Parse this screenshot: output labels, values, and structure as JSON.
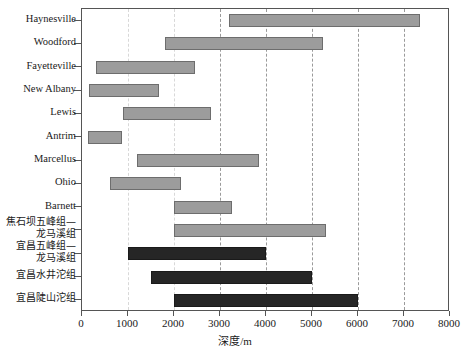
{
  "chart_data": {
    "type": "bar",
    "orientation": "horizontal",
    "subtype": "range-bar",
    "title": "",
    "xlabel": "深度/m",
    "ylabel": "",
    "xlim": [
      0,
      8000
    ],
    "ylim": null,
    "grid": "vertical-dashed",
    "legend": null,
    "xticks": [
      0,
      1000,
      2000,
      3000,
      4000,
      5000,
      6000,
      7000,
      8000
    ],
    "xtick_labels": [
      "0",
      "1000",
      "2000",
      "3000",
      "4000",
      "5000",
      "6000",
      "7000",
      "8000"
    ],
    "categories": [
      "Haynesville",
      "Woodford",
      "Fayetteville",
      "New Albany",
      "Lewis",
      "Antrim",
      "Marcellus",
      "Ohio",
      "Barnett",
      "焦石坝五峰组—\n龙马溪组",
      "宜昌五峰组—\n龙马溪组",
      "宜昌水井沱组",
      "宜昌陡山沱组"
    ],
    "series": [
      {
        "name": "深度区间",
        "ranges": [
          {
            "label": "Haynesville",
            "start": 3200,
            "end": 7350,
            "color": "#9c9c9c"
          },
          {
            "label": "Woodford",
            "start": 1800,
            "end": 5250,
            "color": "#9c9c9c"
          },
          {
            "label": "Fayetteville",
            "start": 300,
            "end": 2450,
            "color": "#9c9c9c"
          },
          {
            "label": "New Albany",
            "start": 150,
            "end": 1670,
            "color": "#9c9c9c"
          },
          {
            "label": "Lewis",
            "start": 900,
            "end": 2800,
            "color": "#9c9c9c"
          },
          {
            "label": "Antrim",
            "start": 130,
            "end": 870,
            "color": "#9c9c9c"
          },
          {
            "label": "Marcellus",
            "start": 1200,
            "end": 3850,
            "color": "#9c9c9c"
          },
          {
            "label": "Ohio",
            "start": 600,
            "end": 2150,
            "color": "#9c9c9c"
          },
          {
            "label": "Barnett",
            "start": 2000,
            "end": 3250,
            "color": "#9c9c9c"
          },
          {
            "label": "焦石坝五峰组—龙马溪组",
            "start": 2000,
            "end": 5300,
            "color": "#9c9c9c"
          },
          {
            "label": "宜昌五峰组—龙马溪组",
            "start": 1000,
            "end": 4000,
            "color": "#262626"
          },
          {
            "label": "宜昌水井沱组",
            "start": 1500,
            "end": 5000,
            "color": "#262626"
          },
          {
            "label": "宜昌陡山沱组",
            "start": 2000,
            "end": 6000,
            "color": "#262626"
          }
        ]
      }
    ],
    "colors": {
      "light_bar_fill": "#9c9c9c",
      "light_bar_edge": "#6d6d6d",
      "dark_bar_fill": "#262626",
      "dark_bar_edge": "#1a1a1a",
      "axis": "#555555",
      "grid": "#9a9a9a",
      "background": "#ffffff"
    }
  },
  "axis": {
    "x_title_text": "深度",
    "x_title_unit": "/m"
  }
}
